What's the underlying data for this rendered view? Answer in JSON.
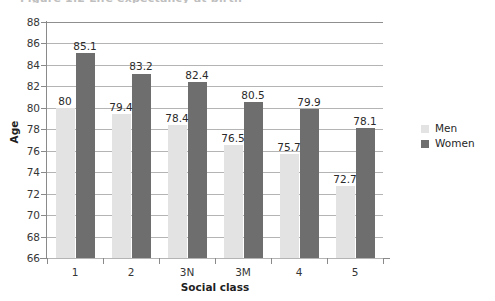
{
  "figure": {
    "caption_sliver": "Figure 1.2 Life expectancy at birth",
    "background_color": "#ffffff"
  },
  "chart_data": {
    "type": "bar",
    "title": "",
    "subtitle": "",
    "xlabel": "Social class",
    "ylabel": "Age",
    "categories": [
      "1",
      "2",
      "3N",
      "3M",
      "4",
      "5"
    ],
    "series": [
      {
        "name": "Men",
        "color": "#e3e3e3",
        "values": [
          80,
          79.4,
          78.4,
          76.5,
          75.7,
          72.7
        ],
        "labels": [
          "80",
          "79.4",
          "78.4",
          "76.5",
          "75.7",
          "72.7"
        ]
      },
      {
        "name": "Women",
        "color": "#6e6e6e",
        "values": [
          85.1,
          83.2,
          82.4,
          80.5,
          79.9,
          78.1
        ],
        "labels": [
          "85.1",
          "83.2",
          "82.4",
          "80.5",
          "79.9",
          "78.1"
        ]
      }
    ],
    "ylim": [
      66,
      88
    ],
    "ytick_step": 2,
    "yticks": [
      88,
      86,
      84,
      82,
      80,
      78,
      76,
      74,
      72,
      70,
      68,
      66
    ],
    "ytick_labels": [
      "88",
      "86",
      "84",
      "82",
      "80",
      "78",
      "76",
      "74",
      "72",
      "70",
      "68",
      "66"
    ],
    "grid": true,
    "grid_axis": "y",
    "legend_position": "right",
    "legend_entries": [
      "Men",
      "Women"
    ]
  }
}
